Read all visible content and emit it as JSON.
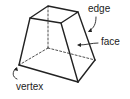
{
  "diagram": {
    "labels": {
      "edge": "edge",
      "face": "face",
      "vertex": "vertex"
    },
    "colors": {
      "stroke": "#222222",
      "background": "#ffffff"
    }
  }
}
